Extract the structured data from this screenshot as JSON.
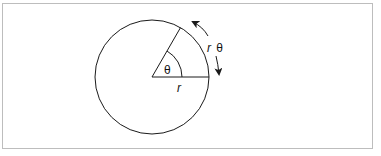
{
  "diagram": {
    "labels": {
      "angle": "θ",
      "radius": "r",
      "arc_r": "r",
      "arc_theta": "θ"
    },
    "colors": {
      "stroke": "#1a1a1a",
      "frame": "#bdbdbd",
      "background": "#ffffff"
    },
    "geometry": {
      "center": [
        152,
        77
      ],
      "radius": 57,
      "angle_deg": 60
    }
  }
}
